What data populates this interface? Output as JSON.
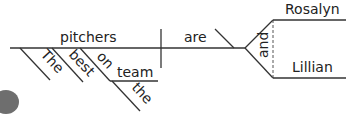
{
  "diagram": {
    "type": "sentence-diagram",
    "subject": {
      "word": "pitchers",
      "modifiers": [
        "The",
        "best"
      ],
      "prep_phrase": {
        "preposition": "on",
        "object": "team",
        "object_modifier": "the"
      }
    },
    "verb": "are",
    "predicate_nominative": {
      "conjunction": "and",
      "words": [
        "Rosalyn",
        "Lillian"
      ]
    }
  },
  "colors": {
    "line": "#333333",
    "text": "#222222",
    "background": "#ffffff"
  }
}
